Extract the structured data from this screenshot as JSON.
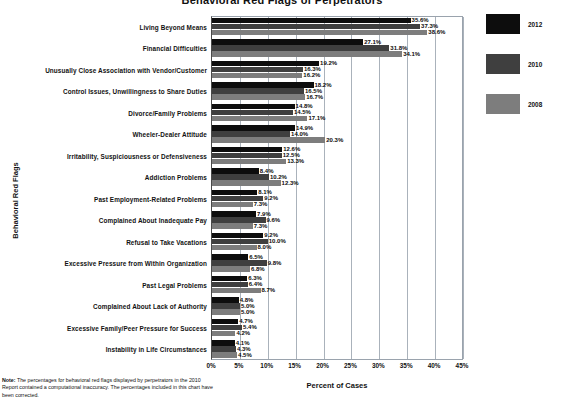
{
  "chart_data": {
    "type": "bar",
    "orientation": "horizontal",
    "title": "Behavioral Red Flags of Perpetrators",
    "xlabel": "Percent of Cases",
    "ylabel": "Behavioral Red Flags",
    "xlim": [
      0,
      45
    ],
    "xticks": [
      "0%",
      "5%",
      "10%",
      "15%",
      "20%",
      "25%",
      "30%",
      "35%",
      "40%",
      "45%"
    ],
    "xtick_values": [
      0,
      5,
      10,
      15,
      20,
      25,
      30,
      35,
      40,
      45
    ],
    "grid": true,
    "legend_position": "right",
    "categories": [
      "Living Beyond Means",
      "Financial Difficulties",
      "Unusually Close Association with Vendor/Customer",
      "Control Issues, Unwillingness to Share Duties",
      "Divorce/Family Problems",
      "Wheeler-Dealer Attitude",
      "Irritability, Suspiciousness or Defensiveness",
      "Addiction Problems",
      "Past Employment-Related Problems",
      "Complained About Inadequate Pay",
      "Refusal to Take Vacations",
      "Excessive Pressure from Within Organization",
      "Past Legal Problems",
      "Complained About Lack of Authority",
      "Excessive Family/Peer Pressure for Success",
      "Instability in Life Circumstances"
    ],
    "series": [
      {
        "name": "2012",
        "color": "#0d0d0d",
        "values": [
          35.6,
          27.1,
          19.2,
          18.2,
          14.8,
          14.9,
          12.6,
          8.4,
          8.1,
          7.9,
          9.2,
          6.5,
          6.3,
          4.8,
          4.7,
          4.1
        ],
        "labels": [
          "35.6%",
          "27.1%",
          "19.2%",
          "18.2%",
          "14.8%",
          "14.9%",
          "12.6%",
          "8.4%",
          "8.1%",
          "7.9%",
          "9.2%",
          "6.5%",
          "6.3%",
          "4.8%",
          "4.7%",
          "4.1%"
        ]
      },
      {
        "name": "2010",
        "color": "#3f3f3f",
        "values": [
          37.3,
          31.8,
          16.3,
          16.5,
          14.5,
          14.0,
          12.5,
          10.2,
          9.2,
          9.6,
          10.0,
          9.8,
          6.4,
          5.0,
          5.4,
          4.3
        ],
        "labels": [
          "37.3%",
          "31.8%",
          "16.3%",
          "16.5%",
          "14.5%",
          "14.0%",
          "12.5%",
          "10.2%",
          "9.2%",
          "9.6%",
          "10.0%",
          "9.8%",
          "6.4%",
          "5.0%",
          "5.4%",
          "4.3%"
        ]
      },
      {
        "name": "2008",
        "color": "#7d7d7d",
        "values": [
          38.6,
          34.1,
          16.2,
          16.7,
          17.1,
          20.3,
          13.3,
          12.3,
          7.3,
          7.3,
          8.0,
          6.8,
          8.7,
          5.0,
          4.2,
          4.5
        ],
        "labels": [
          "38.6%",
          "34.1%",
          "16.2%",
          "16.7%",
          "17.1%",
          "20.3%",
          "13.3%",
          "12.3%",
          "7.3%",
          "7.3%",
          "8.0%",
          "6.8%",
          "8.7%",
          "5.0%",
          "4.2%",
          "4.5%"
        ]
      }
    ]
  },
  "legend": {
    "items": [
      {
        "label": "2012",
        "key": "y2012"
      },
      {
        "label": "2010",
        "key": "y2010"
      },
      {
        "label": "2008",
        "key": "y2008"
      }
    ]
  },
  "footnote": {
    "label": "Note:",
    "text": " The percentages for behavioral red flags displayed by perpetrators in the 2010 Report contained a computational inaccuracy. The percentages included in this chart have been corrected."
  }
}
